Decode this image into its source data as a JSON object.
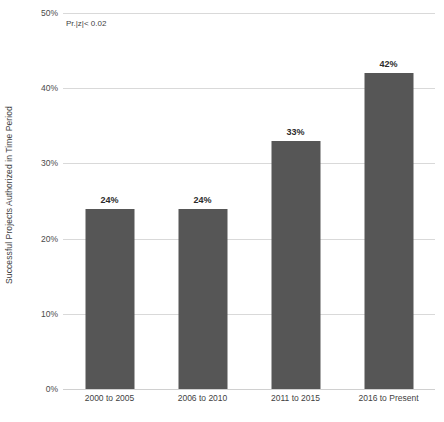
{
  "chart_data": {
    "type": "bar",
    "title": "",
    "xlabel": "",
    "ylabel": "Successful Projects Authorized in Time Period",
    "categories": [
      "2000 to 2005",
      "2006 to 2010",
      "2011 to 2015",
      "2016 to Present"
    ],
    "values": [
      24,
      33,
      42,
      24
    ],
    "value_labels": [
      "24%",
      "24%",
      "33%",
      "42%"
    ],
    "series": [
      {
        "name": "Successful Projects Authorized in Time Period",
        "values": [
          24,
          24,
          33,
          42
        ]
      }
    ],
    "ylim": [
      0,
      50
    ],
    "y_ticks": [
      0,
      10,
      20,
      30,
      40,
      50
    ],
    "y_tick_labels": [
      "0%",
      "10%",
      "20%",
      "30%",
      "40%",
      "50%"
    ],
    "grid": true,
    "legend": "none",
    "annotations": [
      "Pr.|z|< 0.02"
    ],
    "bar_color": "#565656",
    "gridline_color": "#d9d9d9"
  },
  "axes": {
    "y_title": "Successful Projects Authorized in Time Period",
    "x_title": ""
  },
  "annotation": {
    "significance": "Pr.|z|< 0.02"
  }
}
